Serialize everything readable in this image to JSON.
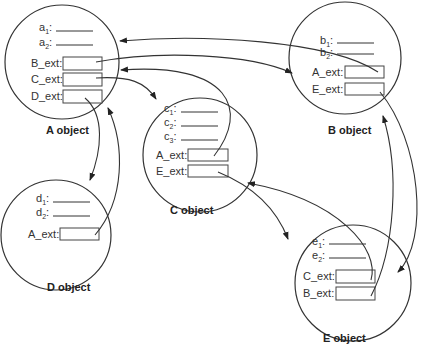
{
  "diagram": {
    "objects": [
      {
        "id": "A",
        "title": "A object",
        "fields": [
          {
            "base": "a",
            "sub": "1"
          },
          {
            "base": "a",
            "sub": "2"
          }
        ],
        "ext": [
          "B_ext:",
          "C_ext:",
          "D_ext:"
        ]
      },
      {
        "id": "B",
        "title": "B object",
        "fields": [
          {
            "base": "b",
            "sub": "1"
          },
          {
            "base": "b",
            "sub": "2"
          }
        ],
        "ext": [
          "A_ext:",
          "E_ext:"
        ]
      },
      {
        "id": "C",
        "title": "C object",
        "fields": [
          {
            "base": "c",
            "sub": "1"
          },
          {
            "base": "c",
            "sub": "2"
          },
          {
            "base": "c",
            "sub": "3"
          }
        ],
        "ext": [
          "A_ext:",
          "E_ext:"
        ]
      },
      {
        "id": "D",
        "title": "D object",
        "fields": [
          {
            "base": "d",
            "sub": "1"
          },
          {
            "base": "d",
            "sub": "2"
          }
        ],
        "ext": [
          "A_ext:"
        ]
      },
      {
        "id": "E",
        "title": "E object",
        "fields": [
          {
            "base": "e",
            "sub": "1"
          },
          {
            "base": "e",
            "sub": "2"
          }
        ],
        "ext": [
          "C_ext:",
          "B_ext:"
        ]
      }
    ],
    "references": [
      {
        "from": "A.B_ext",
        "to": "B"
      },
      {
        "from": "A.C_ext",
        "to": "C"
      },
      {
        "from": "A.D_ext",
        "to": "D"
      },
      {
        "from": "B.A_ext",
        "to": "A"
      },
      {
        "from": "B.E_ext",
        "to": "E"
      },
      {
        "from": "C.A_ext",
        "to": "A"
      },
      {
        "from": "C.E_ext",
        "to": "E"
      },
      {
        "from": "D.A_ext",
        "to": "A"
      },
      {
        "from": "E.C_ext",
        "to": "C"
      },
      {
        "from": "E.B_ext",
        "to": "B"
      }
    ]
  }
}
